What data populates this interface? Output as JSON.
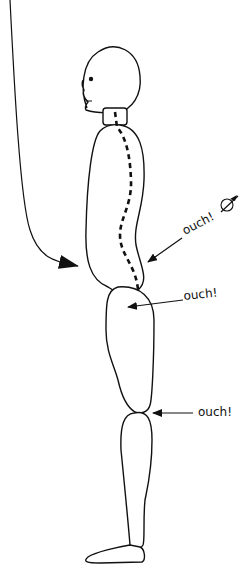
{
  "diagram": {
    "labels": [
      {
        "id": "lower-back",
        "text": "ouch!"
      },
      {
        "id": "hip",
        "text": "ouch!"
      },
      {
        "id": "knee",
        "text": "ouch!"
      }
    ],
    "colors": {
      "stroke": "#111111",
      "background": "#ffffff"
    }
  }
}
